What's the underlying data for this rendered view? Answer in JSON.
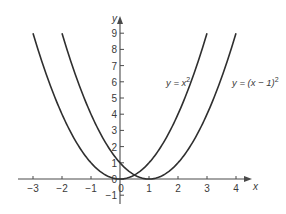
{
  "chart_data": {
    "type": "line",
    "title": "",
    "xlabel": "x",
    "ylabel": "y",
    "xlim": [
      -3.2,
      4.3
    ],
    "ylim": [
      -1.2,
      9.8
    ],
    "grid": false,
    "x_ticks": [
      -3,
      -2,
      -1,
      0,
      1,
      2,
      3,
      4
    ],
    "x_tick_labels": [
      "−3",
      "−2",
      "−1",
      "0",
      "1",
      "2",
      "3",
      "4"
    ],
    "y_ticks": [
      -1,
      0,
      1,
      2,
      3,
      4,
      5,
      6,
      7,
      8,
      9
    ],
    "y_tick_labels": [
      "−1",
      "0",
      "1",
      "2",
      "3",
      "4",
      "5",
      "6",
      "7",
      "8",
      "9"
    ],
    "series": [
      {
        "name": "y = x²",
        "label_base": "y = x",
        "label_sup": "2",
        "function": "x^2",
        "x": [
          -3,
          -2.5,
          -2,
          -1.5,
          -1,
          -0.5,
          0,
          0.5,
          1,
          1.5,
          2,
          2.5,
          3
        ],
        "values": [
          9,
          6.25,
          4,
          2.25,
          1,
          0.25,
          0,
          0.25,
          1,
          2.25,
          4,
          6.25,
          9
        ]
      },
      {
        "name": "y = (x − 1)²",
        "label_base": "y = (x − 1)",
        "label_sup": "2",
        "function": "(x-1)^2",
        "x": [
          -2,
          -1.5,
          -1,
          -0.5,
          0,
          0.5,
          1,
          1.5,
          2,
          2.5,
          3,
          3.5,
          4
        ],
        "values": [
          9,
          6.25,
          4,
          2.25,
          1,
          0.25,
          0,
          0.25,
          1,
          2.25,
          4,
          6.25,
          9
        ]
      }
    ],
    "colors": {
      "curve": "#2f2f2f",
      "axis": "#4a4a4a",
      "text": "#3a3a3a"
    }
  }
}
